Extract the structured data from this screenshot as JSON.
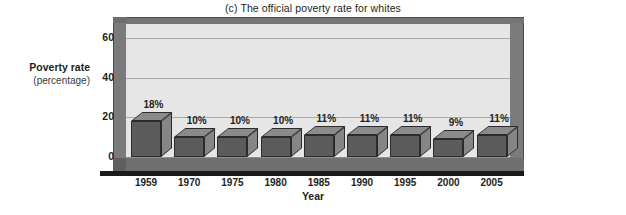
{
  "chart_data": {
    "type": "bar",
    "title": "(c) The official poverty rate for whites",
    "xlabel": "Year",
    "ylabel": "Poverty rate",
    "ylabel_sub": "(percentage)",
    "categories": [
      "1959",
      "1970",
      "1975",
      "1980",
      "1985",
      "1990",
      "1995",
      "2000",
      "2005"
    ],
    "values": [
      18,
      10,
      10,
      10,
      11,
      11,
      11,
      9,
      11
    ],
    "data_labels": [
      "18%",
      "10%",
      "10%",
      "10%",
      "11%",
      "11%",
      "11%",
      "9%",
      "11%"
    ],
    "yticks": [
      0,
      20,
      40,
      60
    ],
    "ytick_labels": [
      "0",
      "20",
      "40",
      "60"
    ],
    "ylim": [
      0,
      68
    ],
    "grid": true,
    "legend": "none",
    "style": "3d-column",
    "colors": {
      "bar_front": "#5c5c5c",
      "bar_top": "#8b8b8b",
      "bar_side": "#868686",
      "plot_background": "#e6e6e6",
      "wall": "#7b7b7b",
      "floor": "#6f6f6f",
      "gridline": "#a9a9a9",
      "text": "#231f20",
      "page_background": "#ffffff"
    }
  }
}
